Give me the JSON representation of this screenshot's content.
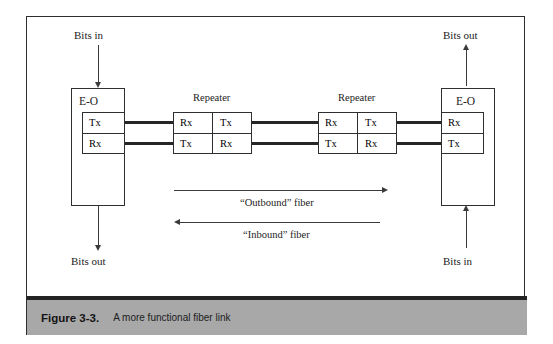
{
  "figure": {
    "caption_number": "Figure 3-3.",
    "caption_text": "A more functional fiber link"
  },
  "diagram": {
    "type": "block-diagram",
    "title": "A more functional fiber link",
    "left_node": {
      "label": "E-O",
      "ports": [
        "Tx",
        "Rx"
      ],
      "top_arrow_label": "Bits in",
      "top_arrow_direction": "down",
      "bottom_arrow_label": "Bits out",
      "bottom_arrow_direction": "down"
    },
    "right_node": {
      "label": "E-O",
      "ports": [
        "Rx",
        "Tx"
      ],
      "top_arrow_label": "Bits out",
      "top_arrow_direction": "up",
      "bottom_arrow_label": "Bits in",
      "bottom_arrow_direction": "up"
    },
    "repeaters": [
      {
        "label": "Repeater",
        "cells": {
          "top_left": "Rx",
          "top_right": "Tx",
          "bottom_left": "Tx",
          "bottom_right": "Rx"
        }
      },
      {
        "label": "Repeater",
        "cells": {
          "top_left": "Rx",
          "top_right": "Tx",
          "bottom_left": "Tx",
          "bottom_right": "Rx"
        }
      }
    ],
    "fiber_paths": [
      {
        "label": "“Outbound” fiber",
        "direction": "right"
      },
      {
        "label": "“Inbound” fiber",
        "direction": "left"
      }
    ],
    "colors": {
      "line": "#262626",
      "frame": "#2e2e2e",
      "caption_bg": "#a8a8a8",
      "caption_rule": "#232323",
      "background": "#ffffff"
    }
  }
}
